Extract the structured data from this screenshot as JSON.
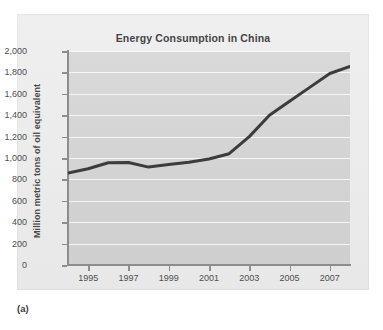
{
  "figure": {
    "caption": "(a)"
  },
  "chart_data": {
    "type": "line",
    "title": "Energy Consumption in China",
    "xlabel": "",
    "ylabel": "Million metric tons of oil equivalent",
    "xlim": [
      1994,
      2008
    ],
    "ylim": [
      0,
      2000
    ],
    "grid": true,
    "legend": "none",
    "line_color": "#3c3c3c",
    "plot_background": "#d6d6d6",
    "figure_background": "#ededed",
    "y_ticks": [
      0,
      200,
      400,
      600,
      800,
      1000,
      1200,
      1400,
      1600,
      1800,
      2000
    ],
    "y_tick_labels": [
      "0",
      "200",
      "400",
      "600",
      "800",
      "1,000",
      "1,200",
      "1,400",
      "1,600",
      "1,800",
      "2,000"
    ],
    "x_ticks": [
      1995,
      1997,
      1999,
      2001,
      2003,
      2005,
      2007
    ],
    "x_tick_labels": [
      "1995",
      "1997",
      "1999",
      "2001",
      "2003",
      "2005",
      "2007"
    ],
    "series": [
      {
        "name": "Energy consumption",
        "x": [
          1994,
          1995,
          1996,
          1997,
          1998,
          1999,
          2000,
          2001,
          2002,
          2003,
          2004,
          2005,
          2006,
          2007,
          2008
        ],
        "values": [
          860,
          900,
          955,
          958,
          915,
          940,
          960,
          990,
          1040,
          1200,
          1400,
          1530,
          1660,
          1790,
          1855
        ]
      }
    ]
  }
}
